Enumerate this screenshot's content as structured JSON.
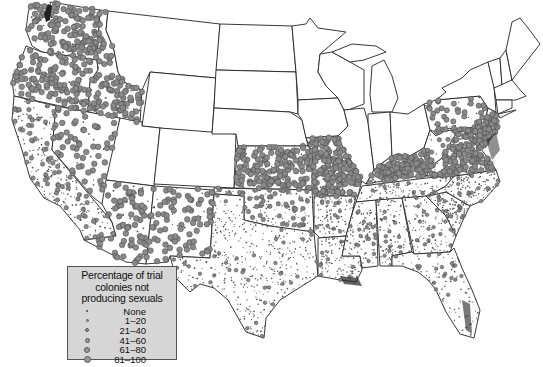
{
  "map": {
    "subject": "Contiguous United States",
    "symbol_color": "#8a8a8a",
    "symbol_stroke": "#444444",
    "border_color": "#222222",
    "background": "#ffffff",
    "high_density_regions": [
      "Washington",
      "Oregon",
      "Northern California",
      "Idaho (west)",
      "Nevada (north)",
      "Arizona",
      "New Mexico",
      "Kansas",
      "Missouri",
      "Kentucky",
      "Virginia",
      "Maryland",
      "Pennsylvania (southeast)",
      "New Jersey"
    ],
    "low_density_regions": [
      "Southern California",
      "Texas",
      "Oklahoma (south)",
      "Louisiana",
      "Mississippi",
      "Alabama",
      "Georgia",
      "Florida",
      "South Carolina",
      "North Carolina",
      "Tennessee",
      "Arkansas"
    ],
    "no_data_regions": [
      "Montana",
      "Wyoming",
      "North Dakota",
      "South Dakota",
      "Nebraska",
      "Minnesota",
      "Iowa",
      "Wisconsin",
      "Michigan",
      "Illinois",
      "Indiana",
      "Ohio",
      "New York",
      "New England",
      "Utah",
      "Colorado"
    ]
  },
  "legend": {
    "title_lines": [
      "Percentage of trial",
      "colonies not",
      "producing sexuals"
    ],
    "items": [
      {
        "label": "None",
        "size": 2
      },
      {
        "label": "1–20",
        "size": 3
      },
      {
        "label": "21–40",
        "size": 4
      },
      {
        "label": "41–60",
        "size": 5
      },
      {
        "label": "61–80",
        "size": 6
      },
      {
        "label": "81–100",
        "size": 7
      }
    ],
    "background": "#d6d6d6"
  }
}
